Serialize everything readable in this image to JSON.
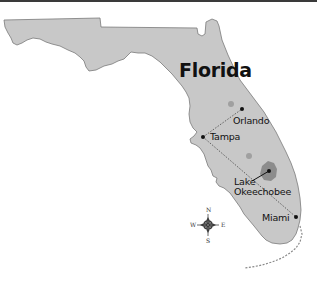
{
  "map": {
    "title": "Florida",
    "colors": {
      "land": "#c8c8c8",
      "outline": "#7a7a7a",
      "lake": "#8c8c8c",
      "lake_small": "#a0a0a0",
      "marker": "#111111",
      "route_line": "#555555",
      "background": "#ffffff"
    },
    "cities": [
      {
        "name": "Orlando"
      },
      {
        "name": "Tampa"
      },
      {
        "name": "Miami"
      }
    ],
    "lake": {
      "line1": "Lake",
      "line2": "Okeechobee"
    },
    "routes": [
      {
        "from": "Tampa",
        "to": "Orlando",
        "style": "dotted"
      },
      {
        "from": "Tampa",
        "to": "Miami",
        "style": "dotted"
      }
    ],
    "compass": {
      "icon": "compass-rose-icon",
      "n": "N",
      "s": "S",
      "e": "E",
      "w": "W"
    }
  }
}
